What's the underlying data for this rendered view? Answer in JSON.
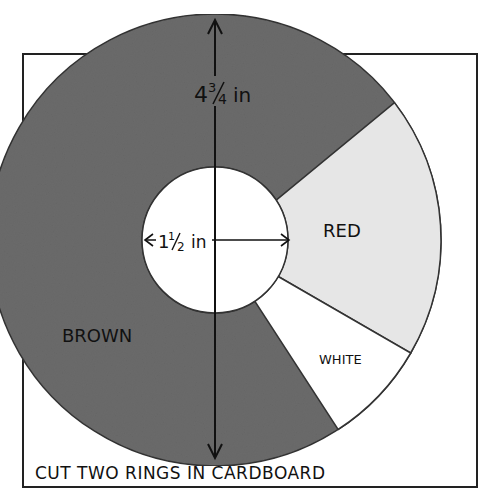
{
  "diagram": {
    "caption": "CUT TWO RINGS IN CARDBOARD",
    "outer_dimension": {
      "whole": "4",
      "num": "3",
      "den": "4",
      "unit": "in"
    },
    "inner_dimension": {
      "whole": "1",
      "num": "1",
      "den": "2",
      "unit": "in"
    },
    "segments": [
      {
        "label": "BROWN",
        "color": "#6e6e6e"
      },
      {
        "label": "RED",
        "color": "#e6e6e6"
      },
      {
        "label": "WHITE",
        "color": "#ffffff"
      }
    ]
  }
}
